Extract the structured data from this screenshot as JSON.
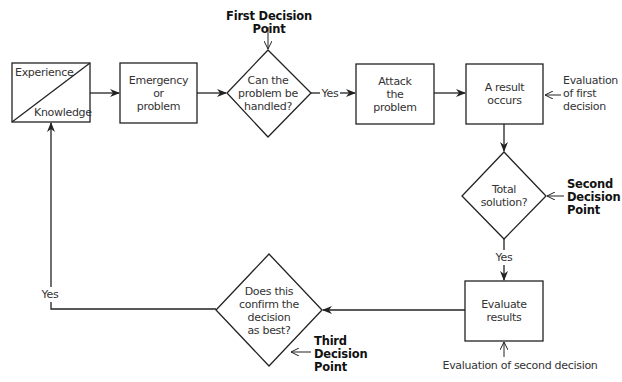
{
  "diagram": {
    "type": "flowchart",
    "nodes": {
      "experience_knowledge": {
        "top": "Experience",
        "bottom": "Knowledge"
      },
      "emergency": {
        "label": "Emergency\nor\nproblem"
      },
      "decision1": {
        "label": "Can the\nproblem be\nhandled?"
      },
      "attack": {
        "label": "Attack\nthe\nproblem"
      },
      "result": {
        "label": "A result\noccurs"
      },
      "decision2": {
        "label": "Total\nsolution?"
      },
      "evaluate": {
        "label": "Evaluate\nresults"
      },
      "decision3": {
        "label": "Does this\nconfirm the\ndecision\nas best?"
      }
    },
    "annotations": {
      "first_decision_point": "First Decision Point",
      "second_decision_point": "Second\nDecision\nPoint",
      "third_decision_point": "Third\nDecision\nPoint",
      "evaluation_first": "Evaluation\nof first\ndecision",
      "evaluation_second": "Evaluation of second decision"
    },
    "edge_labels": {
      "d1_yes": "Yes",
      "d2_yes": "Yes",
      "d3_yes": "Yes"
    },
    "edges": [
      {
        "from": "experience_knowledge",
        "to": "emergency"
      },
      {
        "from": "emergency",
        "to": "decision1"
      },
      {
        "from": "decision1",
        "to": "attack",
        "label": "Yes"
      },
      {
        "from": "attack",
        "to": "result"
      },
      {
        "from": "result",
        "to": "decision2"
      },
      {
        "from": "decision2",
        "to": "evaluate",
        "label": "Yes"
      },
      {
        "from": "evaluate",
        "to": "decision3"
      },
      {
        "from": "decision3",
        "to": "experience_knowledge",
        "label": "Yes"
      }
    ]
  }
}
